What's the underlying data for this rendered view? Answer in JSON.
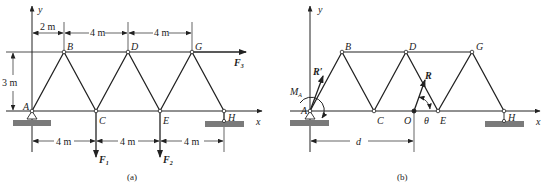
{
  "figure": {
    "panel_a": {
      "caption": "(a)",
      "axes": {
        "x": "x",
        "y": "y"
      },
      "nodes": {
        "A": "A",
        "B": "B",
        "C": "C",
        "D": "D",
        "E": "E",
        "G": "G",
        "H": "H"
      },
      "dimensions": {
        "top": [
          "2 m",
          "4 m",
          "4 m"
        ],
        "height": "3 m",
        "bottom": [
          "4 m",
          "4 m",
          "4 m"
        ]
      },
      "forces": {
        "F1": "F",
        "F1_sub": "1",
        "F2": "F",
        "F2_sub": "2",
        "F3": "F",
        "F3_sub": "3"
      }
    },
    "panel_b": {
      "caption": "(b)",
      "axes": {
        "x": "x",
        "y": "y"
      },
      "nodes": {
        "A": "A",
        "B": "B",
        "C": "C",
        "D": "D",
        "E": "E",
        "G": "G",
        "H": "H",
        "O": "O"
      },
      "resultant": {
        "R_prime": "R′",
        "R": "R",
        "moment": "M",
        "moment_sub": "A",
        "angle": "θ",
        "distance": "d"
      }
    },
    "colors": {
      "line": "#222222",
      "ground": "#7a7a7a"
    }
  }
}
